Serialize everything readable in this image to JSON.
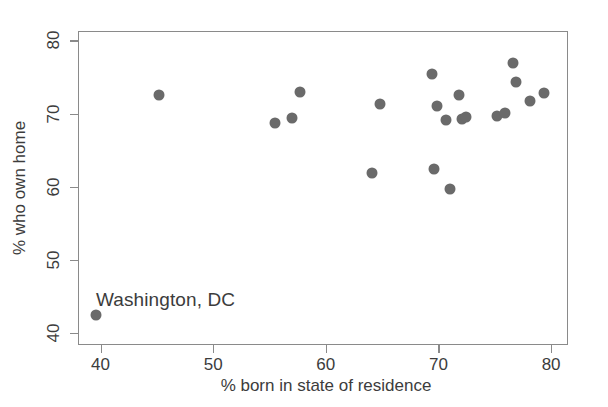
{
  "chart_data": {
    "type": "scatter",
    "title": "",
    "xlabel": "% born in state of residence",
    "ylabel": "% who own home",
    "xlim": [
      38.0,
      81.5
    ],
    "ylim": [
      38.3,
      81.3
    ],
    "xticks": [
      40,
      50,
      60,
      70,
      80
    ],
    "yticks": [
      40,
      50,
      60,
      70,
      80
    ],
    "grid": false,
    "legend": null,
    "marker": {
      "shape": "circle",
      "color": "#6a6a6a",
      "size_px": 11
    },
    "frame_color": "#8a8a8a",
    "background": "#ffffff",
    "annotations": [
      {
        "text": "Washington, DC",
        "x": 39.6,
        "y": 43.6,
        "anchor": "left"
      }
    ],
    "points": [
      {
        "x": 39.5,
        "y": 42.5,
        "label": "Washington, DC"
      },
      {
        "x": 45.1,
        "y": 72.7,
        "label": ""
      },
      {
        "x": 55.4,
        "y": 68.9,
        "label": ""
      },
      {
        "x": 56.9,
        "y": 69.5,
        "label": ""
      },
      {
        "x": 57.6,
        "y": 73.1,
        "label": ""
      },
      {
        "x": 64.0,
        "y": 62.0,
        "label": ""
      },
      {
        "x": 64.7,
        "y": 71.5,
        "label": ""
      },
      {
        "x": 69.3,
        "y": 75.5,
        "label": ""
      },
      {
        "x": 69.5,
        "y": 62.6,
        "label": ""
      },
      {
        "x": 69.8,
        "y": 71.1,
        "label": ""
      },
      {
        "x": 70.6,
        "y": 69.3,
        "label": ""
      },
      {
        "x": 70.9,
        "y": 59.8,
        "label": ""
      },
      {
        "x": 71.7,
        "y": 72.7,
        "label": ""
      },
      {
        "x": 72.0,
        "y": 69.4,
        "label": ""
      },
      {
        "x": 72.4,
        "y": 69.6,
        "label": ""
      },
      {
        "x": 75.1,
        "y": 69.8,
        "label": ""
      },
      {
        "x": 75.8,
        "y": 70.2,
        "label": ""
      },
      {
        "x": 76.5,
        "y": 77.1,
        "label": ""
      },
      {
        "x": 76.8,
        "y": 74.5,
        "label": ""
      },
      {
        "x": 78.0,
        "y": 71.9,
        "label": ""
      },
      {
        "x": 79.3,
        "y": 72.9,
        "label": ""
      },
      {
        "x": 81.9,
        "y": 74.2,
        "label": ""
      }
    ]
  },
  "axes": {
    "x_tick_labels": [
      "40",
      "50",
      "60",
      "70",
      "80"
    ],
    "y_tick_labels": [
      "40",
      "50",
      "60",
      "70",
      "80"
    ],
    "x_title": "% born in state of residence",
    "y_title": "% who own home"
  },
  "annotation_text": "Washington, DC"
}
